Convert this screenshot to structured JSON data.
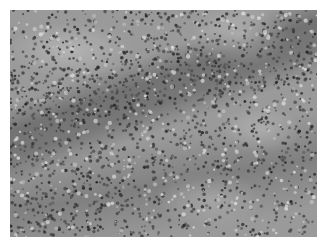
{
  "image": {
    "kind": "grayscale histology micrograph",
    "subject": "dense lymphoid tissue with scattered pale regions",
    "colors": {
      "border": "#ffffff",
      "base_tissue": "#9a9a9a",
      "nuclei": "#3a3a3a",
      "pale_region": "#cfcfcf"
    }
  }
}
